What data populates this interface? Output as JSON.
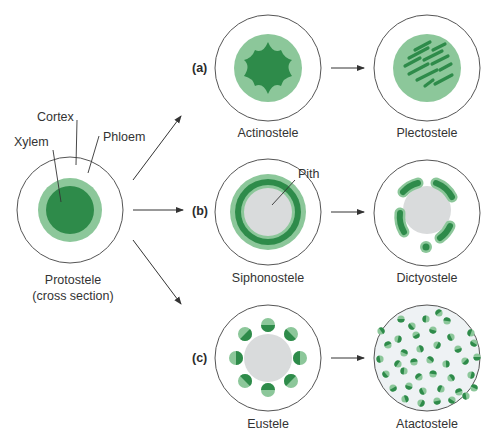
{
  "colors": {
    "outline": "#555555",
    "phloem_light_green": "#8cc79a",
    "xylem_dark_green": "#2e8b4a",
    "pith_gray": "#d9dbdc",
    "atacto_fill": "#eef2f4",
    "text": "#333333"
  },
  "protostele": {
    "labels": {
      "cortex": "Cortex",
      "xylem": "Xylem",
      "phloem": "Phloem"
    },
    "title": "Protostele",
    "subtitle": "(cross section)"
  },
  "rows": [
    {
      "tag": "(a)",
      "from": "Actinostele",
      "to": "Plectostele"
    },
    {
      "tag": "(b)",
      "from": "Siphonostele",
      "to": "Dictyostele",
      "annotation": "Pith"
    },
    {
      "tag": "(c)",
      "from": "Eustele",
      "to": "Atactostele"
    }
  ]
}
